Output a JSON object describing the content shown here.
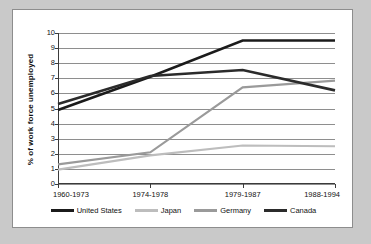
{
  "figure": {
    "background_color": "#c9c9c9",
    "card_color": "#ffffff",
    "border_color": "#8d8d8d"
  },
  "axis": {
    "ylabel": "% of work force unemployed",
    "yticks": [
      "10",
      "9",
      "8",
      "7",
      "6",
      "5",
      "4",
      "3",
      "2",
      "1",
      "0"
    ],
    "xticks": [
      "1960-1973",
      "1974-1978",
      "1979-1987",
      "1988-1994"
    ]
  },
  "legend": {
    "entries": [
      {
        "label": "United States",
        "color": "#1b1b1b"
      },
      {
        "label": "Japan",
        "color": "#bdbdbd"
      },
      {
        "label": "Germany",
        "color": "#9a9a9a"
      },
      {
        "label": "Canada",
        "color": "#2b2b2b"
      }
    ]
  },
  "chart_data": {
    "type": "line",
    "title": "",
    "xlabel": "",
    "ylabel": "% of work force unemployed",
    "categories": [
      "1960-1973",
      "1974-1978",
      "1979-1987",
      "1988-1994"
    ],
    "ylim": [
      0,
      10
    ],
    "ytick_values": [
      0,
      1,
      2,
      3,
      4,
      5,
      6,
      7,
      8,
      9,
      10
    ],
    "grid": true,
    "legend_position": "bottom",
    "series": [
      {
        "name": "United States",
        "color": "#1b1b1b",
        "width": 2.6,
        "values": [
          4.9,
          7.1,
          9.5,
          9.5
        ]
      },
      {
        "name": "Japan",
        "color": "#bdbdbd",
        "width": 2.2,
        "values": [
          0.95,
          1.9,
          2.55,
          2.5
        ]
      },
      {
        "name": "Germany",
        "color": "#9a9a9a",
        "width": 2.2,
        "values": [
          1.3,
          2.1,
          6.4,
          6.85
        ]
      },
      {
        "name": "Canada",
        "color": "#2b2b2b",
        "width": 2.6,
        "values": [
          5.3,
          7.15,
          7.55,
          6.2
        ]
      }
    ]
  }
}
